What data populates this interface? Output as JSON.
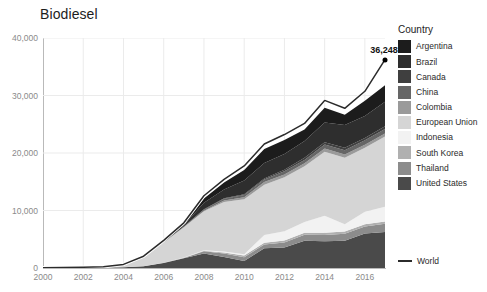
{
  "title": "Biodiesel",
  "legend": {
    "title": "Country",
    "world_label": "World"
  },
  "annotation": {
    "label": "36,248",
    "year": 2017,
    "value": 36248
  },
  "colors": {
    "world_line": "#2b2b2b",
    "axis": "#b9b9b9",
    "grid": "#ebebeb",
    "tick_text": "#8a8a8a",
    "title_text": "#1d1d1d",
    "background": "#ffffff"
  },
  "chart_data": {
    "type": "area",
    "stacked": true,
    "title": "Biodiesel",
    "xlabel": "",
    "ylabel": "",
    "xlim": [
      2000,
      2017
    ],
    "ylim": [
      0,
      40000
    ],
    "grid": true,
    "legend_position": "right",
    "x_ticks": [
      2000,
      2002,
      2004,
      2006,
      2008,
      2010,
      2012,
      2014,
      2016
    ],
    "y_ticks": [
      0,
      10000,
      20000,
      30000,
      40000
    ],
    "y_tick_labels": [
      "0",
      "10,000",
      "20,000",
      "30,000",
      "40,000"
    ],
    "x": [
      2000,
      2001,
      2002,
      2003,
      2004,
      2005,
      2006,
      2007,
      2008,
      2009,
      2010,
      2011,
      2012,
      2013,
      2014,
      2015,
      2016,
      2017
    ],
    "stack_order_bottom_to_top": [
      "United States",
      "Thailand",
      "South Korea",
      "Indonesia",
      "European Union",
      "Colombia",
      "China",
      "Canada",
      "Brazil",
      "Argentina"
    ],
    "series": [
      {
        "name": "Argentina",
        "color": "#1c1c1c",
        "values": [
          0,
          0,
          0,
          0,
          0,
          0,
          30,
          190,
          710,
          1180,
          1820,
          2430,
          2450,
          2010,
          2580,
          1810,
          2660,
          2870
        ]
      },
      {
        "name": "Brazil",
        "color": "#2e2e2e",
        "values": [
          0,
          0,
          0,
          0,
          0,
          20,
          70,
          230,
          1160,
          1540,
          2400,
          2670,
          2720,
          2920,
          3420,
          3940,
          3800,
          4290
        ]
      },
      {
        "name": "Canada",
        "color": "#3f3f3f",
        "values": [
          0,
          0,
          0,
          0,
          0,
          0,
          10,
          20,
          70,
          100,
          130,
          180,
          280,
          370,
          410,
          430,
          420,
          450
        ]
      },
      {
        "name": "China",
        "color": "#666666",
        "values": [
          0,
          0,
          0,
          0,
          0,
          10,
          30,
          70,
          170,
          300,
          380,
          460,
          540,
          600,
          680,
          730,
          780,
          820
        ]
      },
      {
        "name": "Colombia",
        "color": "#9a9a9a",
        "values": [
          0,
          0,
          0,
          0,
          0,
          0,
          0,
          30,
          110,
          260,
          340,
          440,
          490,
          510,
          560,
          580,
          510,
          520
        ]
      },
      {
        "name": "European Union",
        "color": "#d5d5d5",
        "values": [
          10,
          20,
          40,
          90,
          430,
          1640,
          3570,
          5270,
          6770,
          8600,
          9570,
          8740,
          9370,
          9670,
          11120,
          11560,
          11120,
          12200
        ]
      },
      {
        "name": "Indonesia",
        "color": "#f2f2f2",
        "values": [
          0,
          0,
          0,
          0,
          0,
          0,
          0,
          20,
          70,
          190,
          230,
          1370,
          1620,
          1880,
          2960,
          1270,
          2190,
          2550
        ]
      },
      {
        "name": "South Korea",
        "color": "#b0b0b0",
        "values": [
          0,
          0,
          0,
          0,
          0,
          0,
          20,
          50,
          80,
          170,
          290,
          310,
          340,
          360,
          390,
          400,
          400,
          420
        ]
      },
      {
        "name": "Thailand",
        "color": "#8c8c8c",
        "values": [
          0,
          0,
          0,
          0,
          0,
          0,
          30,
          60,
          400,
          610,
          670,
          650,
          900,
          1030,
          1080,
          1180,
          1190,
          1420
        ]
      },
      {
        "name": "United States",
        "color": "#4a4a4a",
        "values": [
          20,
          30,
          60,
          80,
          110,
          300,
          880,
          1690,
          2530,
          1900,
          1200,
          3430,
          3550,
          4750,
          4670,
          4760,
          6020,
          6260
        ]
      }
    ],
    "overlay_line": {
      "name": "World",
      "color": "#2b2b2b",
      "values": [
        40,
        70,
        130,
        230,
        630,
        2050,
        4810,
        7860,
        12570,
        15410,
        17750,
        21570,
        23210,
        25150,
        29150,
        27770,
        30730,
        36248
      ]
    }
  }
}
